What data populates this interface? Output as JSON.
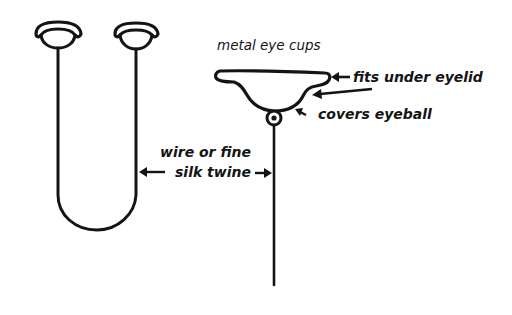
{
  "figure": {
    "background": "#ffffff",
    "ink_color": "#141414",
    "left_assembly": {
      "description": "Two metal eye cups joined by a U-shaped wire",
      "components": [
        "eye-cup-left",
        "eye-cup-right",
        "u-shaped-wire"
      ]
    },
    "right_assembly": {
      "description": "Single eye cup on a pivot with a straight wire",
      "components": [
        "eye-cup-detail",
        "pivot-ring",
        "straight-wire"
      ]
    }
  },
  "labels": {
    "metal_eye_cups": "metal eye cups",
    "fits_under_eyelid": "fits under eyelid",
    "covers_eyeball": "covers eyeball",
    "wire_line1": "wire or fine",
    "wire_line2": "silk twine"
  }
}
